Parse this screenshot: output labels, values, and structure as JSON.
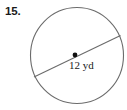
{
  "figure": {
    "problem_number": "15.",
    "shape": "circle",
    "diameter_label": "12 yd",
    "center_dot": true,
    "colors": {
      "background": "#ffffff",
      "stroke": "#6b6b6b",
      "text": "#1a1a1a",
      "dot": "#111111"
    },
    "geometry": {
      "circle_center_x": 77,
      "circle_center_y": 55.5,
      "circle_radius_x": 47,
      "circle_radius_y": 48.5,
      "center_dot_x": 75,
      "center_dot_y": 55,
      "diameter_x1": 34,
      "diameter_y1": 77,
      "diameter_x2": 120,
      "diameter_y2": 36
    }
  }
}
